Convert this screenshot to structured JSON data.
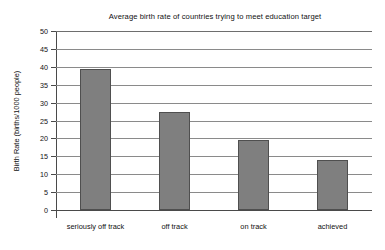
{
  "chart_data": {
    "type": "bar",
    "title": "Average birth rate of countries trying to meet education target",
    "xlabel": "",
    "ylabel": "Birth Rate (births/1000 people)",
    "categories": [
      "seriously off track",
      "off track",
      "on track",
      "achieved"
    ],
    "values": [
      39.3,
      27.5,
      19.6,
      14.0
    ],
    "ylim": [
      0,
      50
    ],
    "ytick_step": 5,
    "yticks": [
      0,
      5,
      10,
      15,
      20,
      25,
      30,
      35,
      40,
      45,
      50
    ],
    "ytick_labels": [
      "0",
      "5",
      "10",
      "15",
      "20",
      "25",
      "30",
      "35",
      "40",
      "45",
      "50"
    ],
    "grid": true,
    "grid_axis": "y",
    "legend": false,
    "legend_position": "none",
    "bar_color": "#7f7f7f",
    "bar_edge_color": "#4f4f4f",
    "grid_color": "#8a8a8a",
    "axis_color": "#4a4a4a",
    "background_color": "#ffffff"
  }
}
